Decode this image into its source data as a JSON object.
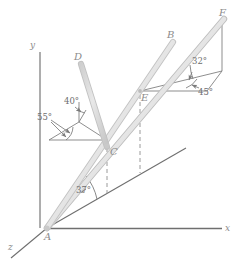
{
  "figure": {
    "background_color": "#ffffff",
    "rod_color": "#d8d8d8",
    "rod_edge_color": "#bdbdbd",
    "line_color": "#808080",
    "label_color": "#8c8c8c",
    "angle_color": "#6e6e6e"
  },
  "axes": [
    {
      "name": "y-axis",
      "label": "y",
      "x": 31,
      "y": 46
    },
    {
      "name": "x-axis",
      "label": "x",
      "x": 226,
      "y": 229
    },
    {
      "name": "z-axis",
      "label": "z",
      "x": 10,
      "y": 247
    }
  ],
  "points": [
    {
      "id": "A",
      "label": "A",
      "px": 47,
      "py": 228,
      "lx": 44,
      "ly": 234
    },
    {
      "id": "B",
      "label": "B",
      "px": 172,
      "py": 40,
      "lx": 168,
      "ly": 34
    },
    {
      "id": "C",
      "label": "C",
      "px": 107,
      "py": 145,
      "lx": 110,
      "ly": 148
    },
    {
      "id": "D",
      "label": "D",
      "px": 80,
      "py": 62,
      "lx": 76,
      "ly": 56
    },
    {
      "id": "E",
      "label": "E",
      "px": 140,
      "py": 91,
      "lx": 141,
      "ly": 94
    },
    {
      "id": "F",
      "label": "F",
      "px": 224,
      "py": 18,
      "lx": 220,
      "ly": 12
    }
  ],
  "angles": [
    {
      "name": "angle-37",
      "label": "37°",
      "x": 76,
      "y": 190
    },
    {
      "name": "angle-40",
      "label": "40°",
      "x": 66,
      "y": 101
    },
    {
      "name": "angle-55",
      "label": "55°",
      "x": 40,
      "y": 117
    },
    {
      "name": "angle-32",
      "label": "32°",
      "x": 193,
      "y": 61
    },
    {
      "name": "angle-45",
      "label": "45°",
      "x": 200,
      "y": 92
    }
  ],
  "members": [
    {
      "name": "member-AB",
      "from": "A",
      "to": "B"
    },
    {
      "name": "member-AF",
      "from": "A",
      "to": "F"
    },
    {
      "name": "member-CD",
      "from": "C",
      "to": "D"
    }
  ],
  "construction_lines": [
    {
      "name": "incline-line-from-A",
      "description": "inclined reference line from A rising to the right"
    },
    {
      "name": "dashed-drop-C",
      "description": "dashed vertical from C down to incline"
    },
    {
      "name": "dashed-drop-E",
      "description": "dashed vertical from E down to incline"
    },
    {
      "name": "projection-box-E",
      "description": "projection parallelogram at E for 32° and 45°"
    },
    {
      "name": "projection-box-C",
      "description": "projection parallelogram at C for 40° and 55°"
    }
  ]
}
